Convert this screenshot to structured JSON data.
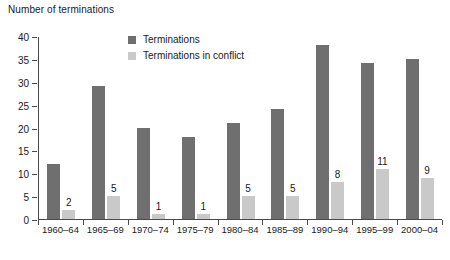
{
  "chart_data": {
    "type": "bar",
    "title": "",
    "ylabel": "Number of terminations",
    "xlabel": "",
    "ylim": [
      0,
      40
    ],
    "ytick_step": 5,
    "yticks": [
      "0",
      "5",
      "10",
      "15",
      "20",
      "25",
      "30",
      "35",
      "40"
    ],
    "grid": false,
    "legend_position": "top-center",
    "categories": [
      "1960–64",
      "1965–69",
      "1970–74",
      "1975–79",
      "1980–84",
      "1985–89",
      "1990–94",
      "1995–99",
      "2000–04"
    ],
    "series": [
      {
        "name": "Terminations",
        "color": "#6f6f6f",
        "values": [
          12,
          29,
          20,
          18,
          21,
          24,
          38,
          34,
          35
        ],
        "labels": [
          "",
          "",
          "",
          "",
          "",
          "",
          "",
          "",
          ""
        ]
      },
      {
        "name": "Terminations in conflict",
        "color": "#c9c9c9",
        "values": [
          2,
          5,
          1,
          1,
          5,
          5,
          8,
          11,
          9
        ],
        "labels": [
          "2",
          "5",
          "1",
          "1",
          "5",
          "5",
          "8",
          "11",
          "9"
        ]
      }
    ]
  },
  "axis": {
    "color": "#4a4a4a"
  }
}
